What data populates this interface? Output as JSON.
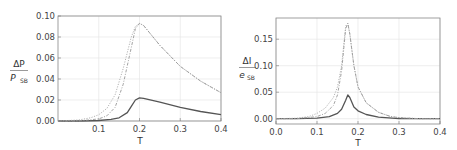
{
  "chart_data": [
    {
      "type": "line",
      "title": "",
      "xlabel": "T",
      "ylabel_num": "ΔP",
      "ylabel_den_main": "P",
      "ylabel_den_sub": "SB",
      "xlim": [
        0.0,
        0.4
      ],
      "ylim": [
        0.0,
        0.1
      ],
      "xticks": [
        "0.1",
        "0.2",
        "0.3",
        "0.4"
      ],
      "yticks": [
        "0.00",
        "0.02",
        "0.04",
        "0.06",
        "0.08",
        "0.10"
      ],
      "grid": true,
      "series": [
        {
          "name": "solid",
          "style": "solid",
          "x": [
            0.0,
            0.05,
            0.1,
            0.13,
            0.15,
            0.17,
            0.18,
            0.19,
            0.2,
            0.21,
            0.25,
            0.3,
            0.35,
            0.4
          ],
          "y": [
            0.0,
            0.0,
            0.0005,
            0.0015,
            0.003,
            0.008,
            0.014,
            0.02,
            0.022,
            0.0215,
            0.018,
            0.013,
            0.009,
            0.006
          ]
        },
        {
          "name": "dotted",
          "style": "dotted",
          "x": [
            0.0,
            0.05,
            0.08,
            0.1,
            0.12,
            0.14,
            0.16,
            0.18,
            0.19,
            0.2,
            0.21,
            0.25,
            0.3,
            0.35,
            0.4
          ],
          "y": [
            0.0,
            0.001,
            0.003,
            0.006,
            0.012,
            0.025,
            0.05,
            0.08,
            0.09,
            0.093,
            0.091,
            0.072,
            0.052,
            0.038,
            0.027
          ]
        },
        {
          "name": "dash-dot",
          "style": "dashdot",
          "x": [
            0.0,
            0.05,
            0.1,
            0.12,
            0.14,
            0.16,
            0.18,
            0.19,
            0.2,
            0.21,
            0.25,
            0.3,
            0.35,
            0.4
          ],
          "y": [
            0.0,
            0.0,
            0.002,
            0.005,
            0.013,
            0.035,
            0.07,
            0.088,
            0.093,
            0.091,
            0.072,
            0.052,
            0.038,
            0.027
          ]
        }
      ]
    },
    {
      "type": "line",
      "title": "",
      "xlabel": "T",
      "ylabel_num": "ΔI",
      "ylabel_den_main": "e",
      "ylabel_den_sub": "SB",
      "xlim": [
        0.0,
        0.4
      ],
      "ylim": [
        -0.01,
        0.19
      ],
      "xticks": [
        "0.0",
        "0.1",
        "0.2",
        "0.3",
        "0.4"
      ],
      "yticks": [
        "0.00",
        "0.05",
        "0.10",
        "0.15"
      ],
      "grid": true,
      "series": [
        {
          "name": "solid",
          "style": "solid",
          "x": [
            0.0,
            0.05,
            0.1,
            0.13,
            0.15,
            0.16,
            0.17,
            0.175,
            0.18,
            0.19,
            0.2,
            0.22,
            0.25,
            0.3,
            0.35,
            0.4
          ],
          "y": [
            0.0,
            0.0,
            0.001,
            0.004,
            0.01,
            0.018,
            0.035,
            0.045,
            0.04,
            0.022,
            0.015,
            0.008,
            0.003,
            0.0,
            0.0,
            0.0
          ]
        },
        {
          "name": "dotted",
          "style": "dotted",
          "x": [
            0.0,
            0.05,
            0.08,
            0.1,
            0.12,
            0.14,
            0.15,
            0.16,
            0.17,
            0.175,
            0.18,
            0.19,
            0.2,
            0.22,
            0.25,
            0.28,
            0.3,
            0.35,
            0.4
          ],
          "y": [
            0.0,
            0.001,
            0.004,
            0.01,
            0.02,
            0.04,
            0.06,
            0.1,
            0.175,
            0.18,
            0.16,
            0.1,
            0.06,
            0.03,
            0.012,
            0.004,
            0.002,
            0.0,
            0.0
          ]
        },
        {
          "name": "dash-dot",
          "style": "dashdot",
          "x": [
            0.0,
            0.05,
            0.1,
            0.12,
            0.14,
            0.15,
            0.16,
            0.17,
            0.175,
            0.18,
            0.19,
            0.2,
            0.22,
            0.25,
            0.28,
            0.3,
            0.35,
            0.4
          ],
          "y": [
            0.0,
            0.0,
            0.004,
            0.01,
            0.025,
            0.045,
            0.09,
            0.17,
            0.18,
            0.16,
            0.1,
            0.06,
            0.03,
            0.012,
            0.004,
            0.002,
            0.0,
            0.0
          ]
        }
      ]
    }
  ]
}
